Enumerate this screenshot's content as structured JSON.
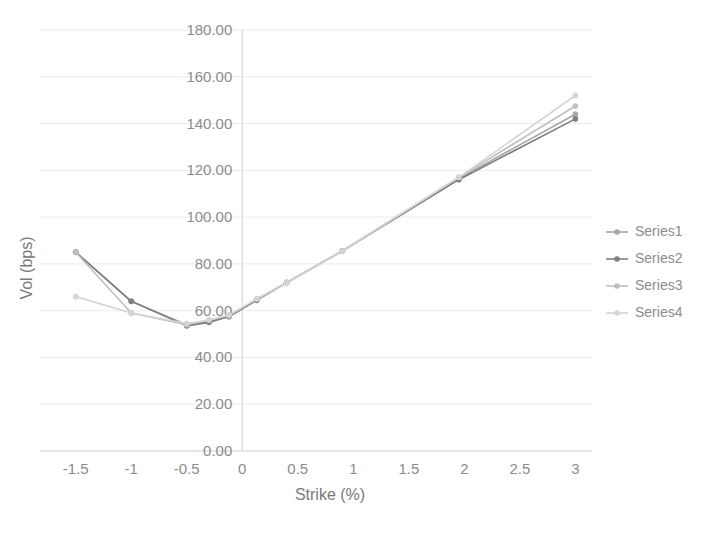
{
  "chart_data": {
    "type": "line",
    "title": "",
    "xlabel": "Strike (%)",
    "ylabel": "Vol (bps)",
    "xlim": [
      -1.75,
      3.15
    ],
    "ylim": [
      0,
      180
    ],
    "ytick_labels": [
      "180.00",
      "160.00",
      "140.00",
      "120.00",
      "100.00",
      "80.00",
      "60.00",
      "40.00",
      "20.00",
      "0.00"
    ],
    "ytick_values": [
      180,
      160,
      140,
      120,
      100,
      80,
      60,
      40,
      20,
      0
    ],
    "xtick_labels": [
      "-1.5",
      "-1",
      "-0.5",
      "0",
      "0.5",
      "1",
      "1.5",
      "2",
      "2.5",
      "3"
    ],
    "xtick_values": [
      -1.5,
      -1,
      -0.5,
      0,
      0.5,
      1,
      1.5,
      2,
      2.5,
      3
    ],
    "grid": true,
    "legend_position": "right",
    "series": [
      {
        "name": "Series1",
        "color": "#a6a6a6",
        "x": [
          -1.5,
          -1.0,
          -0.5,
          -0.3,
          -0.12,
          0.13,
          0.4,
          0.9,
          1.95,
          3.0
        ],
        "values": [
          85.0,
          64.0,
          54.0,
          55.5,
          57.5,
          64.5,
          72.0,
          85.5,
          116.5,
          144.0
        ]
      },
      {
        "name": "Series2",
        "color": "#7f7f7f",
        "x": [
          -1.5,
          -1.0,
          -0.5,
          -0.3,
          -0.12,
          0.13,
          0.4,
          0.9,
          1.95,
          3.0
        ],
        "values": [
          85.0,
          64.0,
          53.5,
          55.0,
          57.5,
          64.5,
          72.0,
          85.5,
          116.0,
          142.0
        ]
      },
      {
        "name": "Series3",
        "color": "#bfbfbf",
        "x": [
          -1.5,
          -1.0,
          -0.5,
          -0.3,
          -0.12,
          0.13,
          0.4,
          0.9,
          1.95,
          3.0
        ],
        "values": [
          85.0,
          59.0,
          54.0,
          56.0,
          58.0,
          65.0,
          72.0,
          85.5,
          117.0,
          147.5
        ]
      },
      {
        "name": "Series4",
        "color": "#d4d4d4",
        "x": [
          -1.5,
          -1.0,
          -0.5,
          -0.3,
          -0.12,
          0.13,
          0.4,
          0.9,
          1.95,
          3.0
        ],
        "values": [
          66.0,
          59.0,
          54.5,
          56.0,
          58.0,
          65.0,
          72.0,
          85.5,
          117.0,
          152.0
        ]
      }
    ]
  },
  "legend": {
    "items": [
      {
        "label": "Series1"
      },
      {
        "label": "Series2"
      },
      {
        "label": "Series3"
      },
      {
        "label": "Series4"
      }
    ]
  },
  "axes": {
    "x_title": "Strike (%)",
    "y_title": "Vol (bps)"
  }
}
